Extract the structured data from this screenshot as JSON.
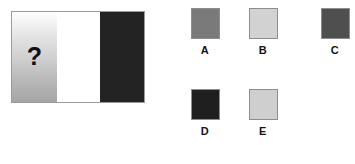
{
  "puzzle": {
    "type": "visual-analogy-matrix",
    "stimulus": {
      "name": "stimulus-panel",
      "bands": [
        {
          "id": "question",
          "label": "?",
          "fill": "gradient-white-to-gray",
          "gradient_from": "#ffffff",
          "gradient_to": "#a6a6a6",
          "width_px": 45
        },
        {
          "id": "white",
          "label": "",
          "fill": "#ffffff",
          "width_px": 43
        },
        {
          "id": "dark",
          "label": "",
          "fill": "#232323",
          "width_px": 44
        }
      ],
      "question_glyph": "?",
      "border_color": "#9a9a9a"
    },
    "options": [
      {
        "id": "a",
        "label": "A",
        "swatch_color": "#7a7a7a",
        "border_color": "#8e8e8e"
      },
      {
        "id": "b",
        "label": "B",
        "swatch_color": "#d2d2d2",
        "border_color": "#8e8e8e"
      },
      {
        "id": "c",
        "label": "C",
        "swatch_color": "#4f4f4f",
        "border_color": "#8e8e8e"
      },
      {
        "id": "d",
        "label": "D",
        "swatch_color": "#1f1f1f",
        "border_color": "#8e8e8e"
      },
      {
        "id": "e",
        "label": "E",
        "swatch_color": "#cfcfcf",
        "border_color": "#8e8e8e"
      }
    ]
  }
}
